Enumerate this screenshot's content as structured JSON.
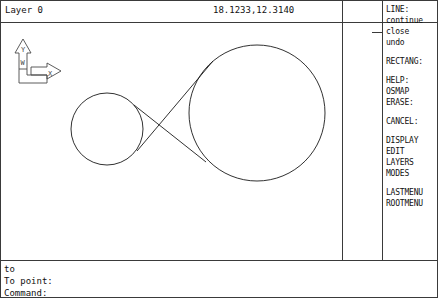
{
  "status_bar": {
    "layer_label": "Layer 0",
    "coordinates": "18.1233,12.3140"
  },
  "screen_menu": {
    "items": [
      {
        "label": "LINE:"
      },
      {
        "label": "continue"
      },
      {
        "label": "close"
      },
      {
        "label": "undo"
      },
      {
        "label": ""
      },
      {
        "label": "RECTANG:"
      },
      {
        "label": ""
      },
      {
        "label": "HELP:"
      },
      {
        "label": "OSMAP"
      },
      {
        "label": "ERASE:"
      },
      {
        "label": ""
      },
      {
        "label": "CANCEL:"
      },
      {
        "label": ""
      },
      {
        "label": "DISPLAY"
      },
      {
        "label": "EDIT"
      },
      {
        "label": "LAYERS"
      },
      {
        "label": "MODES"
      },
      {
        "label": ""
      },
      {
        "label": "LASTMENU"
      },
      {
        "label": "ROOTMENU"
      }
    ]
  },
  "command_area": {
    "lines": [
      {
        "text": "to"
      },
      {
        "text": "To point:"
      },
      {
        "text": "Command:"
      }
    ]
  },
  "ucs_icon": {
    "y_axis_label": "Y",
    "x_axis_label": "X",
    "world_label": "W"
  },
  "drawing": {
    "stroke_color": "#1a1a1a",
    "background_color": "#ffffff",
    "entities": [
      {
        "type": "circle",
        "name": "small-circle",
        "cx": 106,
        "cy": 106,
        "r": 36
      },
      {
        "type": "circle",
        "name": "large-circle",
        "cx": 256,
        "cy": 90,
        "r": 68
      },
      {
        "type": "line",
        "name": "tangent-line-upper",
        "x1": 133,
        "y1": 82,
        "x2": 205,
        "y2": 139
      },
      {
        "type": "line",
        "name": "tangent-line-lower",
        "x1": 136,
        "y1": 128,
        "x2": 212,
        "y2": 38
      }
    ]
  }
}
